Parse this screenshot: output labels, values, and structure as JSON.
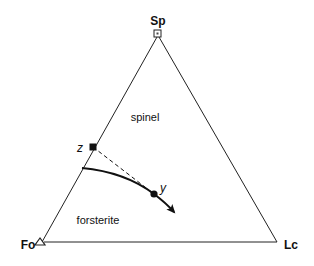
{
  "diagram": {
    "type": "ternary-phase-diagram",
    "vertices": [
      {
        "label": "Sp",
        "marker": "open-square"
      },
      {
        "label": "Fo",
        "marker": "open-triangle"
      },
      {
        "label": "Lc",
        "marker": "none"
      }
    ],
    "fields": [
      {
        "label": "spinel"
      },
      {
        "label": "forsterite"
      }
    ],
    "points": [
      {
        "label": "z",
        "marker": "filled-square"
      },
      {
        "label": "y",
        "marker": "filled-circle"
      }
    ],
    "lines": [
      {
        "from": "z",
        "to": "y",
        "style": "dashed"
      },
      {
        "name": "cotectic-boundary",
        "style": "solid-bold",
        "arrow": "toward Lc-side"
      }
    ]
  },
  "labels": {
    "sp": "Sp",
    "fo": "Fo",
    "lc": "Lc",
    "spinel": "spinel",
    "forsterite": "forsterite",
    "z": "z",
    "y": "y"
  }
}
